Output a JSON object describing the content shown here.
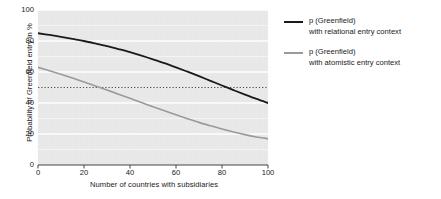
{
  "chart_data": {
    "type": "line",
    "title": "",
    "xlabel": "Number of countries with subsidiaries",
    "ylabel": "Probability of Greenfield entry in %",
    "xlim": [
      0,
      100
    ],
    "ylim": [
      0,
      100
    ],
    "xticks": [
      0,
      20,
      40,
      60,
      80,
      100
    ],
    "yticks": [
      0,
      20,
      40,
      60,
      80,
      100
    ],
    "grid": "horizontal-white-gridlines-on-gray-background",
    "legend_position": "right",
    "reference_lines": [
      {
        "name": "fifty-percent-line",
        "axis": "y",
        "value": 50,
        "style": "dotted",
        "color": "#555555"
      }
    ],
    "x": [
      0,
      5,
      10,
      15,
      20,
      25,
      30,
      35,
      40,
      45,
      50,
      55,
      60,
      65,
      70,
      75,
      80,
      85,
      90,
      95,
      100
    ],
    "series": [
      {
        "name": "p (Greenfield) with relational entry context",
        "color": "#1a1a1a",
        "width": 1.8,
        "values": [
          85.0,
          83.9,
          82.7,
          81.4,
          80.0,
          78.4,
          76.7,
          74.8,
          72.8,
          70.6,
          68.2,
          65.7,
          63.0,
          60.2,
          57.3,
          54.3,
          51.3,
          48.3,
          45.4,
          42.6,
          40.0
        ]
      },
      {
        "name": "p (Greenfield) with atomistic entry context",
        "color": "#9a9a9a",
        "width": 1.6,
        "values": [
          63.0,
          60.8,
          58.5,
          56.1,
          53.6,
          51.0,
          48.4,
          45.7,
          43.0,
          40.3,
          37.6,
          35.0,
          32.4,
          29.9,
          27.5,
          25.3,
          23.2,
          21.3,
          19.6,
          18.1,
          17.0
        ]
      }
    ]
  },
  "axis": {
    "y_title": "Probability of Greenfield entry in %",
    "x_title": "Number of countries with subsidiaries",
    "y_tick_labels": [
      "100",
      "80",
      "60",
      "40",
      "20",
      "0"
    ],
    "x_tick_labels": [
      "0",
      "20",
      "40",
      "60",
      "80",
      "100"
    ]
  },
  "legend": {
    "entries": [
      {
        "line1": "p (Greenfield)",
        "line2": "with relational entry context",
        "color": "#1a1a1a"
      },
      {
        "line1": "p (Greenfield)",
        "line2": "with atomistic entry context",
        "color": "#9a9a9a"
      }
    ]
  },
  "colors": {
    "plot_background": "#e8e8e8",
    "gridline": "#fbfbfb",
    "axis": "#444444",
    "series_relational": "#1a1a1a",
    "series_atomistic": "#9a9a9a",
    "reference_line": "#555555"
  }
}
